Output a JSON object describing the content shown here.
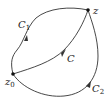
{
  "diagram": {
    "points": {
      "start": {
        "label": "z",
        "subscript": "0"
      },
      "end": {
        "label": "z",
        "subscript": ""
      }
    },
    "paths": [
      {
        "label": "C",
        "subscript": "1",
        "position": "upper-left"
      },
      {
        "label": "C",
        "subscript": "",
        "position": "middle"
      },
      {
        "label": "C",
        "subscript": "2",
        "position": "lower-right"
      }
    ],
    "colors": {
      "stroke": "#333333",
      "background": "#ffffff"
    }
  }
}
